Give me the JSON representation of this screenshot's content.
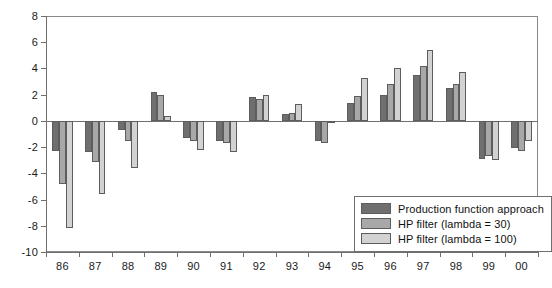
{
  "chart_data": {
    "type": "bar",
    "title": "",
    "subtitle": "",
    "xlabel": "",
    "ylabel": "",
    "ylim": [
      -10,
      8
    ],
    "yticks": [
      -10,
      -8,
      -6,
      -4,
      -2,
      0,
      2,
      4,
      6,
      8
    ],
    "ytick_labels": [
      "-10",
      "-8",
      "-6",
      "-4",
      "-2",
      "0",
      "2",
      "4",
      "6",
      "8"
    ],
    "grid": false,
    "legend_position": "bottom-right",
    "categories": [
      "86",
      "87",
      "88",
      "89",
      "90",
      "91",
      "92",
      "93",
      "94",
      "95",
      "96",
      "97",
      "98",
      "99",
      "00"
    ],
    "series": [
      {
        "name": "Production function approach",
        "color": "#6f6f6f",
        "values": [
          -2.3,
          -2.4,
          -0.7,
          2.2,
          -1.3,
          -1.5,
          1.8,
          0.5,
          -1.5,
          1.4,
          2.0,
          3.5,
          2.5,
          -2.9,
          -2.1
        ]
      },
      {
        "name": "HP filter (lambda = 30)",
        "color": "#a8a8a8",
        "values": [
          -4.8,
          -3.1,
          -1.5,
          2.0,
          -1.5,
          -1.7,
          1.7,
          0.6,
          -1.7,
          1.9,
          2.8,
          4.2,
          2.8,
          -2.7,
          -2.3
        ]
      },
      {
        "name": "HP filter (lambda = 100)",
        "color": "#d2d2d2",
        "values": [
          -8.2,
          -5.6,
          -3.6,
          0.4,
          -2.2,
          -2.4,
          2.0,
          1.3,
          -0.2,
          3.3,
          4.0,
          5.4,
          3.7,
          -3.0,
          -1.5
        ]
      }
    ]
  },
  "legend": {
    "items": [
      {
        "label": "Production function approach"
      },
      {
        "label": "HP filter (lambda = 30)"
      },
      {
        "label": "HP filter (lambda = 100)"
      }
    ]
  }
}
